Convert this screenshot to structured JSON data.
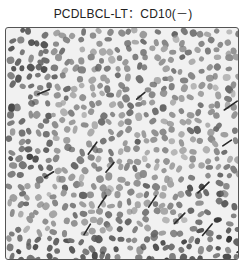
{
  "figure": {
    "title": "PCDLBCL-LT：CD10(－)",
    "image_description": "Grayscale micrograph of densely packed tumor cell nuclei, immunostain negative for CD10",
    "colors": {
      "background": "#f1f1f1",
      "nuclei_light": "#9a9a9a",
      "nuclei_dark": "#3a3a3a",
      "border": "#555555"
    }
  }
}
